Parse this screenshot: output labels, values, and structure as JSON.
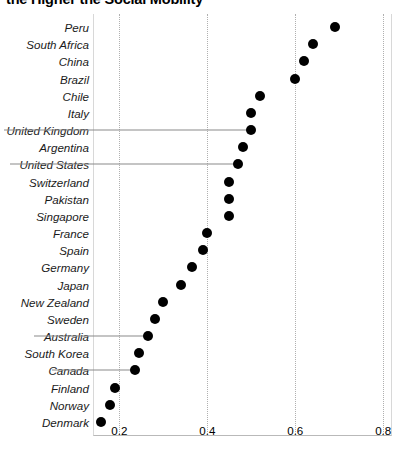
{
  "chart_data": {
    "type": "scatter",
    "title": "the Higher the Social Mobility",
    "subtitle": "",
    "xlabel": "",
    "ylabel": "",
    "xlim": [
      0.14,
      0.82
    ],
    "xticks": [
      0.2,
      0.4,
      0.6,
      0.8
    ],
    "xticklabels": [
      "0.2",
      "0.4",
      "0.6",
      "0.8"
    ],
    "grid": "vertical-dotted",
    "legend": "none",
    "orientation": "horizontal",
    "categories": [
      "Peru",
      "South Africa",
      "China",
      "Brazil",
      "Chile",
      "Italy",
      "United Kingdom",
      "Argentina",
      "United States",
      "Switzerland",
      "Pakistan",
      "Singapore",
      "France",
      "Spain",
      "Germany",
      "Japan",
      "New Zealand",
      "Sweden",
      "Australia",
      "South Korea",
      "Canada",
      "Finland",
      "Norway",
      "Denmark"
    ],
    "values": [
      0.69,
      0.64,
      0.62,
      0.6,
      0.52,
      0.5,
      0.5,
      0.48,
      0.47,
      0.45,
      0.45,
      0.45,
      0.4,
      0.39,
      0.365,
      0.34,
      0.3,
      0.28,
      0.265,
      0.245,
      0.235,
      0.19,
      0.178,
      0.158
    ],
    "leader_line_categories": [
      "United Kingdom",
      "United States",
      "Australia",
      "Canada"
    ]
  }
}
